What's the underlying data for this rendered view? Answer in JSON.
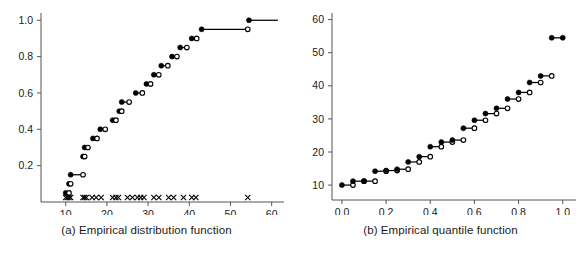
{
  "figure": {
    "panels": [
      {
        "id": "a",
        "caption": "(a) Empirical distribution function"
      },
      {
        "id": "b",
        "caption": "(b) Empirical quantile function"
      }
    ]
  },
  "chart_data": [
    {
      "type": "line",
      "subtype": "step-ecdf",
      "title": "(a) Empirical distribution function",
      "xlabel": "",
      "ylabel": "",
      "xlim": [
        4,
        63
      ],
      "ylim": [
        0,
        1.04
      ],
      "xticks": [
        10,
        20,
        30,
        40,
        50,
        60
      ],
      "yticks": [
        0.2,
        0.4,
        0.6,
        0.8,
        1.0
      ],
      "xtick_labels": [
        "10",
        "20",
        "30",
        "40",
        "50",
        "60"
      ],
      "ytick_labels": [
        "0.2",
        "0.4",
        "0.6",
        "0.8",
        "1.0"
      ],
      "grid": false,
      "legend": "none",
      "notes": "Right-continuous step function. Filled circle = value attained at jump; open circle = limit from the left at next jump. Rug of x marks along the horizontal axis shows the raw observations.",
      "x": [
        10.0,
        10.8,
        11.2,
        14.2,
        14.4,
        14.8,
        15.2,
        17.0,
        18.6,
        21.6,
        23.0,
        23.6,
        27.2,
        29.6,
        31.6,
        33.2,
        36.0,
        38.0,
        41.0,
        43.0,
        54.5
      ],
      "y": [
        0.05,
        0.1,
        0.15,
        0.25,
        0.3,
        0.3,
        0.3,
        0.35,
        0.4,
        0.45,
        0.5,
        0.55,
        0.6,
        0.65,
        0.7,
        0.75,
        0.8,
        0.85,
        0.9,
        0.95,
        1.0
      ],
      "steps": [
        {
          "x_start": 10.0,
          "x_end": 10.8,
          "y": 0.05,
          "left_marker": "closed",
          "right_marker": "open"
        },
        {
          "x_start": 10.8,
          "x_end": 11.2,
          "y": 0.1,
          "left_marker": "closed",
          "right_marker": "open"
        },
        {
          "x_start": 11.2,
          "x_end": 14.2,
          "y": 0.15,
          "left_marker": "closed",
          "right_marker": "open"
        },
        {
          "x_start": 14.2,
          "x_end": 14.6,
          "y": 0.25,
          "left_marker": "closed",
          "right_marker": "open"
        },
        {
          "x_start": 14.6,
          "x_end": 15.4,
          "y": 0.3,
          "left_marker": "closed",
          "right_marker": "open"
        },
        {
          "x_start": 16.6,
          "x_end": 17.6,
          "y": 0.35,
          "left_marker": "closed",
          "right_marker": "open"
        },
        {
          "x_start": 18.4,
          "x_end": 19.6,
          "y": 0.4,
          "left_marker": "closed",
          "right_marker": "open"
        },
        {
          "x_start": 21.4,
          "x_end": 22.2,
          "y": 0.45,
          "left_marker": "closed",
          "right_marker": "open"
        },
        {
          "x_start": 23.0,
          "x_end": 23.6,
          "y": 0.5,
          "left_marker": "closed",
          "right_marker": "open"
        },
        {
          "x_start": 23.6,
          "x_end": 25.4,
          "y": 0.55,
          "left_marker": "closed",
          "right_marker": "open"
        },
        {
          "x_start": 27.0,
          "x_end": 28.6,
          "y": 0.6,
          "left_marker": "closed",
          "right_marker": "open"
        },
        {
          "x_start": 29.6,
          "x_end": 30.6,
          "y": 0.65,
          "left_marker": "closed",
          "right_marker": "open"
        },
        {
          "x_start": 31.4,
          "x_end": 32.6,
          "y": 0.7,
          "left_marker": "closed",
          "right_marker": "open"
        },
        {
          "x_start": 33.2,
          "x_end": 34.8,
          "y": 0.75,
          "left_marker": "closed",
          "right_marker": "open"
        },
        {
          "x_start": 35.8,
          "x_end": 37.0,
          "y": 0.8,
          "left_marker": "closed",
          "right_marker": "open"
        },
        {
          "x_start": 37.8,
          "x_end": 39.4,
          "y": 0.85,
          "left_marker": "closed",
          "right_marker": "open"
        },
        {
          "x_start": 40.6,
          "x_end": 41.8,
          "y": 0.9,
          "left_marker": "closed",
          "right_marker": "open"
        },
        {
          "x_start": 43.0,
          "x_end": 54.2,
          "y": 0.95,
          "left_marker": "closed",
          "right_marker": "open"
        },
        {
          "x_start": 54.5,
          "x_end": 61.5,
          "y": 1.0,
          "left_marker": "closed",
          "right_marker": "none"
        }
      ],
      "rug_marks": [
        10.0,
        10.4,
        10.8,
        11.2,
        14.2,
        14.6,
        15.0,
        16.4,
        17.4,
        18.6,
        21.4,
        22.2,
        22.8,
        25.0,
        26.2,
        27.4,
        28.2,
        29.0,
        31.4,
        32.6,
        35.0,
        36.2,
        38.6,
        40.6,
        41.6,
        54.2
      ]
    },
    {
      "type": "line",
      "subtype": "step-quantile",
      "title": "(b) Empirical quantile function",
      "xlabel": "",
      "ylabel": "",
      "xlim": [
        -0.045,
        1.06
      ],
      "ylim": [
        5.5,
        62
      ],
      "xticks": [
        0.0,
        0.2,
        0.4,
        0.6,
        0.8,
        1.0
      ],
      "yticks": [
        10,
        20,
        30,
        40,
        50,
        60
      ],
      "xtick_labels": [
        "0.0",
        "0.2",
        "0.4",
        "0.6",
        "0.8",
        "1.0"
      ],
      "ytick_labels": [
        "10",
        "20",
        "30",
        "40",
        "50",
        "60"
      ],
      "grid": false,
      "legend": "none",
      "notes": "Inverse of panel (a): probability on the horizontal axis, data value on the vertical axis. Each plateau spans 0.05 of probability.",
      "p": [
        0.0,
        0.05,
        0.1,
        0.15,
        0.2,
        0.25,
        0.3,
        0.35,
        0.4,
        0.45,
        0.5,
        0.55,
        0.6,
        0.65,
        0.7,
        0.75,
        0.8,
        0.85,
        0.9,
        0.95
      ],
      "q": [
        10.0,
        11.2,
        11.2,
        14.2,
        14.4,
        14.8,
        17.0,
        18.6,
        21.6,
        23.0,
        23.6,
        27.2,
        29.6,
        31.6,
        33.2,
        36.0,
        38.0,
        41.0,
        43.0,
        54.5
      ],
      "steps": [
        {
          "p_start": 0.0,
          "p_end": 0.05,
          "value": 10.0,
          "left_marker": "closed",
          "right_marker": "open"
        },
        {
          "p_start": 0.05,
          "p_end": 0.1,
          "value": 11.2,
          "left_marker": "closed",
          "right_marker": "open"
        },
        {
          "p_start": 0.1,
          "p_end": 0.15,
          "value": 11.2,
          "left_marker": "closed",
          "right_marker": "open"
        },
        {
          "p_start": 0.15,
          "p_end": 0.2,
          "value": 14.2,
          "left_marker": "closed",
          "right_marker": "open"
        },
        {
          "p_start": 0.2,
          "p_end": 0.25,
          "value": 14.4,
          "left_marker": "closed",
          "right_marker": "open"
        },
        {
          "p_start": 0.25,
          "p_end": 0.3,
          "value": 14.8,
          "left_marker": "closed",
          "right_marker": "open"
        },
        {
          "p_start": 0.3,
          "p_end": 0.35,
          "value": 17.0,
          "left_marker": "closed",
          "right_marker": "open"
        },
        {
          "p_start": 0.35,
          "p_end": 0.4,
          "value": 18.6,
          "left_marker": "closed",
          "right_marker": "open"
        },
        {
          "p_start": 0.4,
          "p_end": 0.45,
          "value": 21.6,
          "left_marker": "closed",
          "right_marker": "open"
        },
        {
          "p_start": 0.45,
          "p_end": 0.5,
          "value": 23.0,
          "left_marker": "closed",
          "right_marker": "open"
        },
        {
          "p_start": 0.5,
          "p_end": 0.55,
          "value": 23.6,
          "left_marker": "closed",
          "right_marker": "open"
        },
        {
          "p_start": 0.55,
          "p_end": 0.6,
          "value": 27.2,
          "left_marker": "closed",
          "right_marker": "open"
        },
        {
          "p_start": 0.6,
          "p_end": 0.65,
          "value": 29.6,
          "left_marker": "closed",
          "right_marker": "open"
        },
        {
          "p_start": 0.65,
          "p_end": 0.7,
          "value": 31.6,
          "left_marker": "closed",
          "right_marker": "open"
        },
        {
          "p_start": 0.7,
          "p_end": 0.75,
          "value": 33.2,
          "left_marker": "closed",
          "right_marker": "open"
        },
        {
          "p_start": 0.75,
          "p_end": 0.8,
          "value": 36.0,
          "left_marker": "closed",
          "right_marker": "open"
        },
        {
          "p_start": 0.8,
          "p_end": 0.85,
          "value": 38.0,
          "left_marker": "closed",
          "right_marker": "open"
        },
        {
          "p_start": 0.85,
          "p_end": 0.9,
          "value": 41.0,
          "left_marker": "closed",
          "right_marker": "open"
        },
        {
          "p_start": 0.9,
          "p_end": 0.95,
          "value": 43.0,
          "left_marker": "closed",
          "right_marker": "open"
        },
        {
          "p_start": 0.95,
          "p_end": 1.0,
          "value": 54.5,
          "left_marker": "closed",
          "right_marker": "closed"
        }
      ]
    }
  ],
  "colors": {
    "ink": "#000000",
    "axis": "#555555",
    "background": "#ffffff",
    "marker_open_fill": "#ffffff"
  }
}
